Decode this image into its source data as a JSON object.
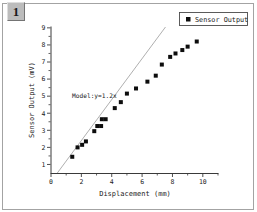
{
  "badge": {
    "label": "1"
  },
  "chart_data": {
    "type": "scatter",
    "title": "",
    "xlabel": "Displacement (mm)",
    "ylabel": "Sensor Output (mV)",
    "xlim": [
      0,
      11
    ],
    "ylim": [
      0.5,
      9.05
    ],
    "x_ticks": [
      0,
      2,
      4,
      6,
      8,
      10
    ],
    "x_minor_ticks": [
      1,
      3,
      5,
      7,
      9,
      11
    ],
    "y_ticks": [
      1,
      2,
      3,
      4,
      5,
      6,
      7,
      8,
      9
    ],
    "y_minor_ticks": [
      1.5,
      2.5,
      3.5,
      4.5,
      5.5,
      6.5,
      7.5,
      8.5
    ],
    "grid": "off",
    "legend": {
      "label": "Sensor Output",
      "position": "top-right"
    },
    "series": [
      {
        "name": "Sensor Output",
        "marker": "square",
        "color": "#0d0d0d",
        "points": [
          [
            1.4,
            1.45
          ],
          [
            1.75,
            2.0
          ],
          [
            2.05,
            2.15
          ],
          [
            2.3,
            2.35
          ],
          [
            2.85,
            2.95
          ],
          [
            3.05,
            3.25
          ],
          [
            3.3,
            3.25
          ],
          [
            3.35,
            3.65
          ],
          [
            3.6,
            3.65
          ],
          [
            4.2,
            4.3
          ],
          [
            4.6,
            4.65
          ],
          [
            5.0,
            5.15
          ],
          [
            5.6,
            5.45
          ],
          [
            6.35,
            5.85
          ],
          [
            6.9,
            6.2
          ],
          [
            7.3,
            6.85
          ],
          [
            7.85,
            7.3
          ],
          [
            8.2,
            7.5
          ],
          [
            8.65,
            7.7
          ],
          [
            9.0,
            7.9
          ],
          [
            9.6,
            8.2
          ]
        ]
      }
    ],
    "model_line": {
      "label": "Model:y=1.2x",
      "slope": 1.2,
      "color": "#a6a6a6"
    }
  }
}
